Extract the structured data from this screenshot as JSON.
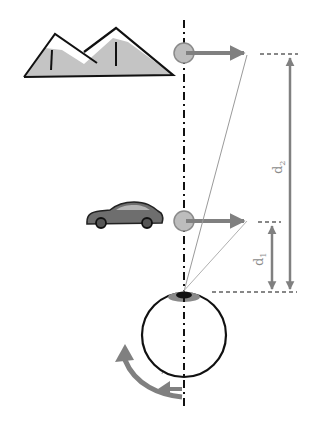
{
  "diagram": {
    "type": "vergence / distance perception illustration",
    "objects": [
      {
        "id": "mountains",
        "label": "far object (mountains)"
      },
      {
        "id": "car",
        "label": "near object (car)"
      },
      {
        "id": "eye",
        "label": "eye"
      }
    ],
    "labels": {
      "d1_main": "d",
      "d1_sub": "1",
      "d2_main": "d",
      "d2_sub": "2"
    },
    "colors": {
      "arrow_gray": "#808080",
      "mountain_fill": "#c4c4c4",
      "target_circle": "#bdbdbd",
      "outline": "#111111",
      "sight_line": "#9a9a9a",
      "background": "#ffffff"
    }
  }
}
